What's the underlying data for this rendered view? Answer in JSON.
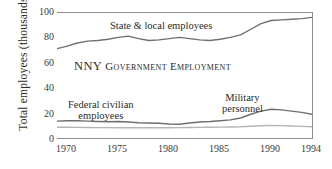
{
  "chart_data": {
    "type": "line",
    "title": "NNY Government Employment",
    "xlabel": "",
    "ylabel": "Total employees (thousands)",
    "xlim": [
      1969,
      1994
    ],
    "ylim": [
      0,
      100
    ],
    "xticks": [
      "1970",
      "1975",
      "1980",
      "1985",
      "1990",
      "1994"
    ],
    "xtick_values": [
      1970,
      1975,
      1980,
      1985,
      1990,
      1994
    ],
    "yticks": [
      "0",
      "20",
      "40",
      "60",
      "80",
      "100"
    ],
    "ytick_values": [
      0,
      20,
      40,
      60,
      80,
      100
    ],
    "grid": false,
    "legend": "in-plot direct labels",
    "x": [
      1969,
      1970,
      1971,
      1972,
      1973,
      1974,
      1975,
      1976,
      1977,
      1978,
      1979,
      1980,
      1981,
      1982,
      1983,
      1984,
      1985,
      1986,
      1987,
      1988,
      1989,
      1990,
      1991,
      1992,
      1993,
      1994
    ],
    "series": [
      {
        "name": "State & local employees",
        "color": "#6f6f6f",
        "values": [
          71.5,
          73.5,
          76.0,
          77.5,
          78.0,
          79.0,
          80.5,
          81.5,
          79.5,
          78.0,
          78.5,
          79.5,
          80.5,
          79.5,
          78.5,
          78.0,
          79.0,
          80.5,
          82.5,
          87.0,
          91.5,
          94.0,
          94.5,
          95.0,
          95.5,
          96.5
        ]
      },
      {
        "name": "Military personnel",
        "color": "#6f6f6f",
        "values": [
          13.5,
          13.8,
          13.8,
          13.5,
          13.2,
          13.0,
          13.2,
          12.8,
          12.2,
          12.0,
          11.8,
          11.2,
          11.0,
          12.0,
          12.8,
          13.2,
          13.8,
          14.5,
          16.0,
          19.0,
          21.5,
          23.0,
          22.5,
          21.5,
          20.5,
          19.0
        ]
      },
      {
        "name": "Federal civilian employees",
        "color": "#b4b4b4",
        "values": [
          8.6,
          8.6,
          8.5,
          8.4,
          8.3,
          8.3,
          8.2,
          8.2,
          8.2,
          8.2,
          8.2,
          8.2,
          8.3,
          8.4,
          8.5,
          8.6,
          8.7,
          8.8,
          9.0,
          9.4,
          9.8,
          10.1,
          9.9,
          9.6,
          9.3,
          9.0
        ]
      }
    ],
    "annotations": [
      {
        "name": "state-local-label",
        "text": "State & local employees"
      },
      {
        "name": "federal-civilian-label",
        "line1": "Federal civilian",
        "line2": "employees"
      },
      {
        "name": "military-label",
        "line1": "Military",
        "line2": "personnel"
      }
    ]
  },
  "title_parts": {
    "lead": "NNY",
    "rest": "Government Employment"
  }
}
